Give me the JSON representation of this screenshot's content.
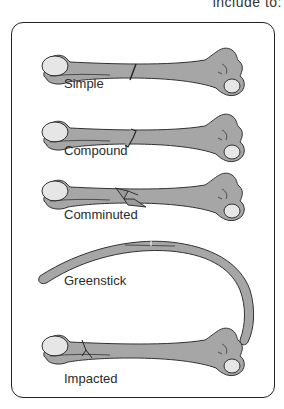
{
  "header": {
    "partial_text": "include to:"
  },
  "diagram": {
    "colors": {
      "bone": "#a6a6a6",
      "bone_head": "#e6e6e6",
      "outline": "#333333",
      "frame": "#222222"
    },
    "fractures": [
      {
        "label": "Simple"
      },
      {
        "label": "Compound"
      },
      {
        "label": "Comminuted"
      },
      {
        "label": "Greenstick"
      },
      {
        "label": "Impacted"
      }
    ]
  }
}
